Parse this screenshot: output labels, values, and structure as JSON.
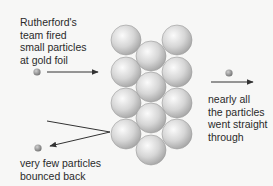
{
  "diagram": {
    "labels": {
      "fired": [
        "Rutherford's",
        "team fired",
        "small particles",
        "at gold foil"
      ],
      "through": [
        "nearly all",
        "the particles",
        "went straight",
        "through"
      ],
      "bounced": [
        "very few particles",
        "bounced back"
      ]
    },
    "colors": {
      "background": "#f7f7f6",
      "atom": "#c8c8c8",
      "particle": "#8a8a8a",
      "arrow": "#333333",
      "text": "#2a2a2a"
    },
    "gold_foil": {
      "atoms": [
        {
          "cx": 126,
          "cy": 40
        },
        {
          "cx": 126,
          "cy": 72
        },
        {
          "cx": 126,
          "cy": 103
        },
        {
          "cx": 126,
          "cy": 134
        },
        {
          "cx": 151,
          "cy": 56
        },
        {
          "cx": 151,
          "cy": 87
        },
        {
          "cx": 151,
          "cy": 118
        },
        {
          "cx": 151,
          "cy": 150
        },
        {
          "cx": 177,
          "cy": 40
        },
        {
          "cx": 177,
          "cy": 72
        },
        {
          "cx": 177,
          "cy": 103
        },
        {
          "cx": 177,
          "cy": 134
        }
      ],
      "atom_radius": 15
    }
  }
}
